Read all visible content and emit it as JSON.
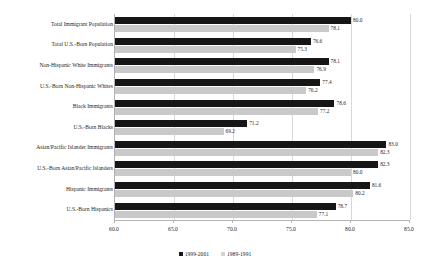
{
  "title_clipped": "HEALTH INSURANCE COVERAGE",
  "chart_data": {
    "type": "bar",
    "orientation": "horizontal",
    "title": "",
    "xlabel": "",
    "ylabel": "",
    "xlim": [
      60.0,
      85.0
    ],
    "xticks": [
      "60.0",
      "65.0",
      "70.0",
      "75.0",
      "80.0",
      "85.0"
    ],
    "grid": true,
    "legend_position": "bottom",
    "categories": [
      "Total Immigrant Population",
      "Total U.S.-Born Population",
      "Non-Hispanic White Immigrants",
      "U.S.-Born Non-Hispanic Whites",
      "Black Immigrants",
      "U.S.-Born Blacks",
      "Asian/Pacific Islander Immigrants",
      "U.S.-Born Asian/Pacific Islanders",
      "Hispanic Immigrants",
      "U.S.-Born Hispanics"
    ],
    "series": [
      {
        "name": "1999-2001",
        "color": "#161616",
        "values": [
          80.0,
          76.6,
          78.1,
          77.4,
          78.6,
          71.2,
          83.0,
          82.3,
          81.6,
          78.7
        ],
        "labels": [
          "80.0",
          "76.6",
          "78.1",
          "77.4",
          "78.6",
          "71.2",
          "83.0",
          "82.3",
          "81.6",
          "78.7"
        ]
      },
      {
        "name": "1989-1991",
        "color": "#c9c9c9",
        "values": [
          78.1,
          75.3,
          76.9,
          76.2,
          77.2,
          69.2,
          82.3,
          80.0,
          80.2,
          77.1
        ],
        "labels": [
          "78.1",
          "75.3",
          "76.9",
          "76.2",
          "77.2",
          "69.2",
          "82.3",
          "80.0",
          "80.2",
          "77.1"
        ]
      }
    ]
  }
}
